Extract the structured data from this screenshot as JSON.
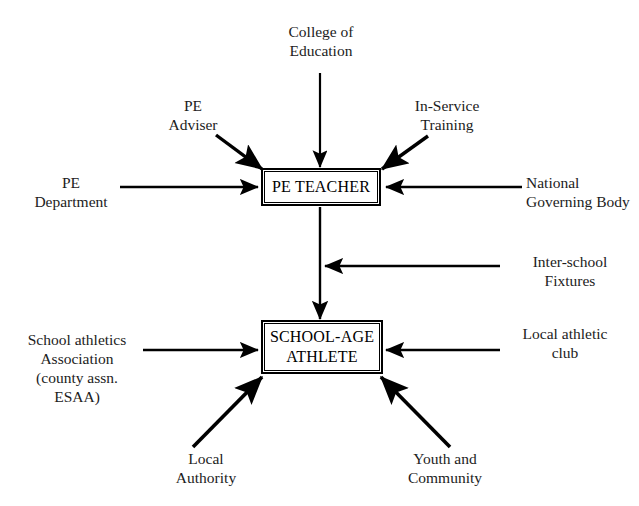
{
  "diagram": {
    "nodes": [
      {
        "id": "pe-teacher",
        "label": "PE TEACHER"
      },
      {
        "id": "school-age-athlete",
        "label": "SCHOOL-AGE\nATHLETE"
      }
    ],
    "sources": [
      {
        "id": "college-of-education",
        "label": "College of\nEducation",
        "target": "pe-teacher"
      },
      {
        "id": "pe-adviser",
        "label": "PE\nAdviser",
        "target": "pe-teacher"
      },
      {
        "id": "in-service-training",
        "label": "In-Service\nTraining",
        "target": "pe-teacher"
      },
      {
        "id": "pe-department",
        "label": "PE\nDepartment",
        "target": "pe-teacher"
      },
      {
        "id": "national-governing-body",
        "label": "National\nGoverning Body",
        "target": "pe-teacher"
      },
      {
        "id": "inter-school-fixtures",
        "label": "Inter-school\nFixtures",
        "target": "pe-teacher-to-athlete-link"
      },
      {
        "id": "school-athletics-association",
        "label": "School athletics\nAssociation\n(county assn.\nESAA)",
        "target": "school-age-athlete"
      },
      {
        "id": "local-athletic-club",
        "label": "Local athletic\nclub",
        "target": "school-age-athlete"
      },
      {
        "id": "local-authority",
        "label": "Local\nAuthority",
        "target": "school-age-athlete"
      },
      {
        "id": "youth-and-community",
        "label": "Youth and\nCommunity",
        "target": "school-age-athlete"
      }
    ],
    "colors": {
      "background": "#ffffff",
      "stroke": "#000000",
      "text": "#1c1c1c"
    }
  }
}
